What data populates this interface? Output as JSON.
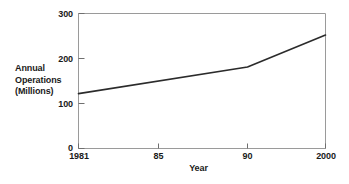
{
  "chart_data": {
    "type": "line",
    "title": "",
    "xlabel": "Year",
    "ylabel_lines": [
      "Annual",
      "Operations",
      "(Millions)"
    ],
    "ylabel": "Annual Operations (Millions)",
    "x": [
      1981,
      1990,
      2000
    ],
    "values": [
      122,
      181,
      252
    ],
    "series": [
      {
        "name": "Annual Operations",
        "points": [
          {
            "x": 1981,
            "y": 122
          },
          {
            "x": 1990,
            "y": 181
          },
          {
            "x": 2000,
            "y": 252
          }
        ]
      }
    ],
    "xlim": [
      1981,
      2000
    ],
    "ylim": [
      0,
      300
    ],
    "xticks": [
      1981,
      1985,
      1990,
      2000
    ],
    "xtick_labels": [
      "1981",
      "85",
      "90",
      "2000"
    ],
    "yticks": [
      0,
      100,
      200,
      300
    ],
    "ytick_labels": [
      "0",
      "100",
      "200",
      "300"
    ],
    "grid": false,
    "legend": false,
    "line_color": "#2b2b2b",
    "axis_color": "#8a8a8a",
    "background_color": "#ffffff"
  }
}
